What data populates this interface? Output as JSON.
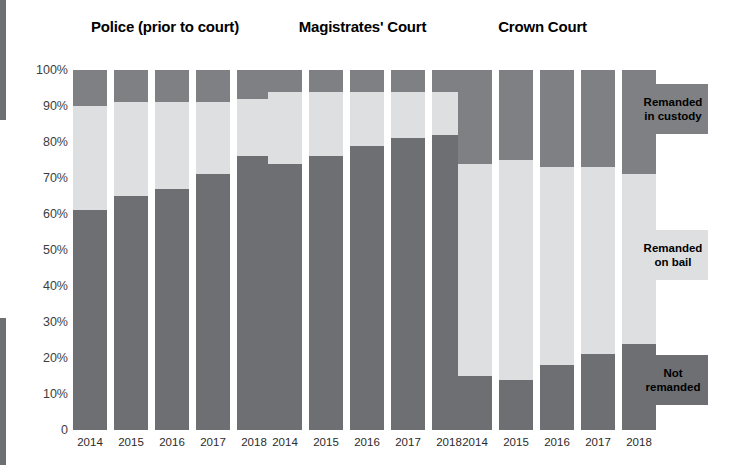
{
  "chart_data": {
    "type": "bar",
    "subtype": "stacked-percentage",
    "title": "",
    "xlabel": "",
    "ylabel": "",
    "ylim": [
      0,
      100
    ],
    "grid": false,
    "legend_position": "right",
    "y_tick_labels": [
      "100%",
      "90%",
      "80%",
      "70%",
      "60%",
      "50%",
      "40%",
      "30%",
      "20%",
      "10%",
      "0"
    ],
    "y_tick_values": [
      100,
      90,
      80,
      70,
      60,
      50,
      40,
      30,
      20,
      10,
      0
    ],
    "categories": [
      "2014",
      "2015",
      "2016",
      "2017",
      "2018"
    ],
    "series": [
      {
        "name": "Not remanded",
        "color": "#6d6f72"
      },
      {
        "name": "Remanded on bail",
        "color": "#dedfe0"
      },
      {
        "name": "Remanded in custody",
        "color": "#7e8083"
      }
    ],
    "groups": [
      {
        "name": "Police (prior to court)",
        "categories": [
          "2014",
          "2015",
          "2016",
          "2017",
          "2018"
        ],
        "values": {
          "Not remanded": [
            61,
            65,
            67,
            71,
            76
          ],
          "Remanded on bail": [
            29,
            26,
            24,
            20,
            16
          ],
          "Remanded in custody": [
            10,
            9,
            9,
            9,
            8
          ]
        }
      },
      {
        "name": "Magistrates' Court",
        "categories": [
          "2014",
          "2015",
          "2016",
          "2017",
          "2018"
        ],
        "values": {
          "Not remanded": [
            74,
            76,
            79,
            81,
            82
          ],
          "Remanded on bail": [
            20,
            18,
            15,
            13,
            12
          ],
          "Remanded in custody": [
            6,
            6,
            6,
            6,
            6
          ]
        }
      },
      {
        "name": "Crown Court",
        "categories": [
          "2014",
          "2015",
          "2016",
          "2017",
          "2018"
        ],
        "values": {
          "Not remanded": [
            15,
            14,
            18,
            21,
            24
          ],
          "Remanded on bail": [
            59,
            61,
            55,
            52,
            47
          ],
          "Remanded in custody": [
            26,
            25,
            27,
            27,
            29
          ]
        }
      }
    ],
    "legend": [
      {
        "label": "Remanded in custody",
        "color": "#7e8083"
      },
      {
        "label": "Remanded on bail",
        "color": "#dedfe0"
      },
      {
        "label": "Not remanded",
        "color": "#6d6f72"
      }
    ],
    "colors": {
      "custody": "#7e8083",
      "bail": "#dedfe0",
      "not_remanded": "#6d6f72",
      "background": "#ffffff",
      "tick_text": "#3d3d3d",
      "title_text": "#000000"
    }
  },
  "legend_labels": {
    "custody_line1": "Remanded",
    "custody_line2": "in custody",
    "bail_line1": "Remanded",
    "bail_line2": "on bail",
    "not_line1": "Not",
    "not_line2": "remanded"
  }
}
